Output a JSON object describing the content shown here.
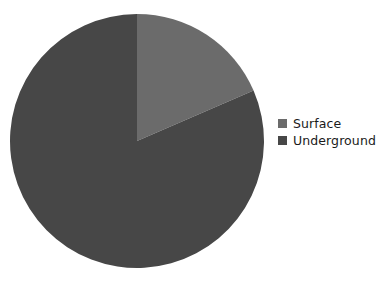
{
  "chart_data": {
    "type": "pie",
    "title": "",
    "subtitle": "",
    "xlabel": "",
    "ylabel": "",
    "grid": false,
    "legend_position": "right",
    "start_angle_deg": 0,
    "direction": "clockwise",
    "center": {
      "x": 137,
      "y": 141
    },
    "radius": 127,
    "categories": [
      "Surface",
      "Underground"
    ],
    "values": [
      18.5,
      81.5
    ],
    "slices": [
      {
        "label": "Surface",
        "value": 18.5,
        "percent": "18.5%",
        "color": "#6b6b6b",
        "start_deg": 0,
        "end_deg": 66.6
      },
      {
        "label": "Underground",
        "value": 81.5,
        "percent": "81.5%",
        "color": "#474747",
        "start_deg": 66.6,
        "end_deg": 360
      }
    ],
    "annotations": []
  },
  "legend": {
    "items": [
      {
        "label": "Surface",
        "color": "#6b6b6b",
        "swatch_icon": "square-swatch-icon"
      },
      {
        "label": "Underground",
        "color": "#474747",
        "swatch_icon": "square-swatch-icon"
      }
    ]
  },
  "colors": {
    "background": "#ffffff",
    "surface": "#6b6b6b",
    "underground": "#474747",
    "legend_text": "#1a1a1a"
  }
}
